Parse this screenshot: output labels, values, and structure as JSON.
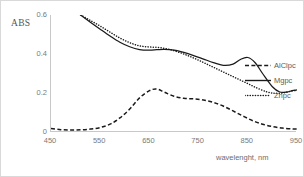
{
  "chart_data": {
    "type": "line",
    "title": "",
    "xlabel": "wavelenght, nm",
    "ylabel": "ABS",
    "xlim": [
      450,
      950
    ],
    "ylim": [
      0,
      0.6
    ],
    "xticks": [
      450,
      550,
      650,
      750,
      850,
      950
    ],
    "yticks": [
      0,
      0.2,
      0.4,
      0.6
    ],
    "xtick_labels": [
      "450",
      "550",
      "650",
      "750",
      "850",
      "950"
    ],
    "ytick_labels": [
      "0",
      "0.2",
      "0.4",
      "0.6"
    ],
    "grid": false,
    "legend_position": "right",
    "series": [
      {
        "name": "AlClpc",
        "style": "dashed",
        "color": "#1a1a1a",
        "x": [
          450,
          470,
          490,
          510,
          530,
          550,
          570,
          590,
          610,
          630,
          650,
          665,
          680,
          700,
          720,
          740,
          760,
          780,
          800,
          820,
          840,
          860,
          880,
          900,
          920,
          940,
          950
        ],
        "y": [
          0.018,
          0.012,
          0.01,
          0.011,
          0.015,
          0.023,
          0.04,
          0.072,
          0.118,
          0.175,
          0.212,
          0.22,
          0.205,
          0.183,
          0.173,
          0.17,
          0.164,
          0.152,
          0.133,
          0.108,
          0.082,
          0.058,
          0.04,
          0.028,
          0.02,
          0.016,
          0.015
        ]
      },
      {
        "name": "Mgpc",
        "style": "solid",
        "color": "#1a1a1a",
        "x": [
          510,
          530,
          550,
          570,
          590,
          610,
          630,
          650,
          665,
          680,
          700,
          720,
          740,
          760,
          780,
          800,
          820,
          835,
          850,
          865,
          880,
          900,
          915,
          930,
          940,
          950
        ],
        "y": [
          0.6,
          0.563,
          0.527,
          0.492,
          0.46,
          0.437,
          0.423,
          0.42,
          0.422,
          0.424,
          0.42,
          0.408,
          0.392,
          0.374,
          0.356,
          0.342,
          0.348,
          0.372,
          0.382,
          0.355,
          0.3,
          0.232,
          0.205,
          0.205,
          0.212,
          0.216
        ]
      },
      {
        "name": "Znpc",
        "style": "dotted",
        "color": "#1a1a1a",
        "x": [
          510,
          530,
          550,
          570,
          590,
          610,
          630,
          650,
          670,
          690,
          710,
          730,
          750,
          770,
          790,
          810,
          830,
          850,
          870,
          890,
          905,
          920,
          935,
          950
        ],
        "y": [
          0.6,
          0.572,
          0.543,
          0.512,
          0.482,
          0.458,
          0.442,
          0.436,
          0.433,
          0.424,
          0.409,
          0.39,
          0.368,
          0.344,
          0.32,
          0.296,
          0.272,
          0.248,
          0.224,
          0.205,
          0.199,
          0.2,
          0.208,
          0.214
        ]
      }
    ]
  },
  "legend": {
    "items": [
      {
        "label": "AlClpc",
        "style": "dashed"
      },
      {
        "label": "Mgpc",
        "style": "solid"
      },
      {
        "label": "Znpc",
        "style": "dotted"
      }
    ]
  }
}
